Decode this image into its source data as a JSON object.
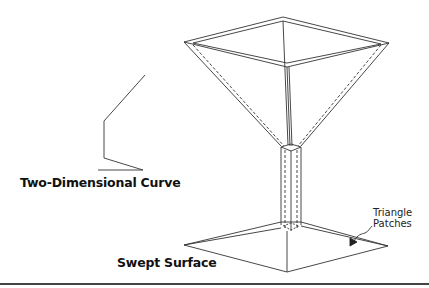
{
  "figure": {
    "labels": {
      "curve": "Two-Dimensional Curve",
      "surface": "Swept Surface",
      "patches_line1": "Triangle",
      "patches_line2": "Patches"
    },
    "colors": {
      "line": "#333333",
      "text": "#111111",
      "background": "#ffffff",
      "rule": "#444444"
    }
  }
}
